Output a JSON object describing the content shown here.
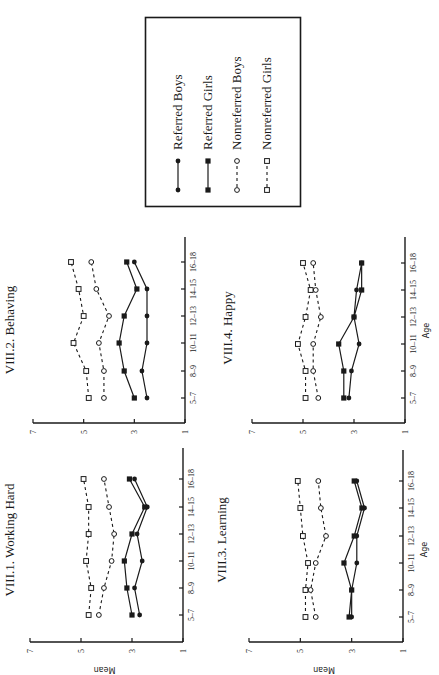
{
  "figure": {
    "orientation": "rotated 90 degrees counter-clockwise",
    "legend": {
      "items": [
        {
          "label": "Referred Boys",
          "marker": "filled-circle",
          "line": "solid"
        },
        {
          "label": "Referred Girls",
          "marker": "filled-square",
          "line": "solid"
        },
        {
          "label": "Nonreferred Boys",
          "marker": "open-circle",
          "line": "dashed"
        },
        {
          "label": "Nonreferred Girls",
          "marker": "open-square",
          "line": "dashed"
        }
      ]
    }
  },
  "chart_data": [
    {
      "type": "line",
      "title": "VIII.1. Working Hard",
      "xlabel": "Age",
      "ylabel": "Mean",
      "categories": [
        "5-7",
        "8-9",
        "10-11",
        "12-13",
        "14-15",
        "16-18"
      ],
      "ylim": [
        1,
        7
      ],
      "yticks": [
        1,
        3,
        5,
        7
      ],
      "series": [
        {
          "name": "Referred Boys",
          "values": [
            2.7,
            2.9,
            2.6,
            2.8,
            2.4,
            2.9
          ]
        },
        {
          "name": "Referred Girls",
          "values": [
            3.0,
            3.2,
            3.3,
            3.0,
            2.5,
            3.1
          ]
        },
        {
          "name": "Nonreferred Boys",
          "values": [
            4.3,
            4.1,
            3.8,
            3.7,
            3.9,
            4.1
          ]
        },
        {
          "name": "Nonreferred Girls",
          "values": [
            4.7,
            4.6,
            4.8,
            4.7,
            4.7,
            4.9
          ]
        }
      ]
    },
    {
      "type": "line",
      "title": "VIII.2. Behaving",
      "xlabel": "",
      "ylabel": "",
      "categories": [
        "5-7",
        "8-9",
        "10-11",
        "12-13",
        "14-15",
        "16-18"
      ],
      "ylim": [
        1,
        7
      ],
      "yticks": [
        1,
        3,
        5,
        7
      ],
      "series": [
        {
          "name": "Referred Boys",
          "values": [
            2.5,
            2.7,
            2.5,
            2.5,
            2.5,
            3.0
          ]
        },
        {
          "name": "Referred Girls",
          "values": [
            3.0,
            3.4,
            3.6,
            3.4,
            2.9,
            3.3
          ]
        },
        {
          "name": "Nonreferred Boys",
          "values": [
            4.2,
            4.2,
            4.4,
            4.0,
            4.5,
            4.7
          ]
        },
        {
          "name": "Nonreferred Girls",
          "values": [
            4.8,
            4.9,
            5.4,
            5.0,
            5.2,
            5.5
          ]
        }
      ]
    },
    {
      "type": "line",
      "title": "VIII.3. Learning",
      "xlabel": "Age",
      "ylabel": "Mean",
      "categories": [
        "5-7",
        "8-9",
        "10-11",
        "12-13",
        "14-15",
        "16-18"
      ],
      "ylim": [
        1,
        7
      ],
      "yticks": [
        1,
        3,
        5,
        7
      ],
      "series": [
        {
          "name": "Referred Boys",
          "values": [
            3.0,
            3.0,
            2.8,
            2.8,
            2.5,
            2.8
          ]
        },
        {
          "name": "Referred Girls",
          "values": [
            3.1,
            3.0,
            3.3,
            2.9,
            2.6,
            2.9
          ]
        },
        {
          "name": "Nonreferred Boys",
          "values": [
            4.4,
            4.6,
            4.4,
            4.0,
            4.2,
            4.3
          ]
        },
        {
          "name": "Nonreferred Girls",
          "values": [
            4.8,
            4.8,
            4.7,
            4.9,
            5.0,
            5.1
          ]
        }
      ]
    },
    {
      "type": "line",
      "title": "VIII.4. Happy",
      "xlabel": "Age",
      "ylabel": "",
      "categories": [
        "5-7",
        "8-9",
        "10-11",
        "12-13",
        "14-15",
        "16-18"
      ],
      "ylim": [
        1,
        7
      ],
      "yticks": [
        1,
        3,
        5,
        7
      ],
      "series": [
        {
          "name": "Referred Boys",
          "values": [
            3.2,
            3.1,
            2.8,
            3.0,
            2.9,
            2.7
          ]
        },
        {
          "name": "Referred Girls",
          "values": [
            3.4,
            3.4,
            3.6,
            3.0,
            2.7,
            2.7
          ]
        },
        {
          "name": "Nonreferred Boys",
          "values": [
            4.4,
            4.6,
            4.6,
            4.3,
            4.5,
            4.6
          ]
        },
        {
          "name": "Nonreferred Girls",
          "values": [
            4.9,
            4.9,
            5.2,
            4.9,
            4.7,
            5.0
          ]
        }
      ]
    }
  ]
}
